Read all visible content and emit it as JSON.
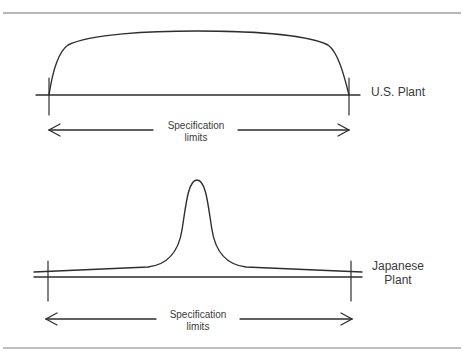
{
  "figure": {
    "colors": {
      "line": "#2e2e2e",
      "rule": "#707070",
      "text": "#3a3a3a",
      "background": "#ffffff"
    },
    "top_panel": {
      "plant_label": "U.S. Plant",
      "spec_label_line1": "Specification",
      "spec_label_line2": "limits",
      "description": "Broad, flat distribution spanning the full specification limits"
    },
    "bottom_panel": {
      "plant_label_line1": "Japanese",
      "plant_label_line2": "Plant",
      "spec_label_line1": "Specification",
      "spec_label_line2": "limits",
      "description": "Narrow, peaked distribution centered within the specification limits"
    }
  }
}
